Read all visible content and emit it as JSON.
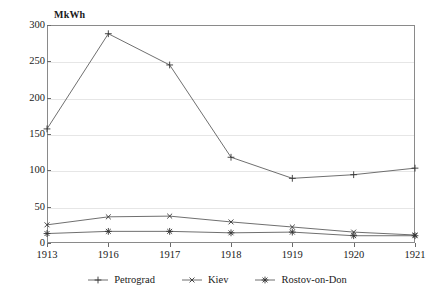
{
  "chart_data": {
    "type": "line",
    "title": "",
    "subtitle": "",
    "xlabel": "",
    "ylabel": "MkWh",
    "ylim": [
      0,
      300
    ],
    "yticks": [
      0,
      50,
      100,
      150,
      200,
      250,
      300
    ],
    "ytick_labels": [
      "0",
      "50",
      "100",
      "150",
      "200",
      "250",
      "300"
    ],
    "categories": [
      "1913",
      "1916",
      "1917",
      "1918",
      "1919",
      "1920",
      "1921"
    ],
    "x": [
      1913,
      1916,
      1917,
      1918,
      1919,
      1920,
      1921
    ],
    "grid": true,
    "grid_axis": "y",
    "legend_position": "bottom-center",
    "series": [
      {
        "name": "Petrograd",
        "marker": "plus",
        "values": [
          157,
          288,
          245,
          118,
          89,
          94,
          103
        ]
      },
      {
        "name": "Kiev",
        "marker": "x-cross",
        "values": [
          25,
          36,
          37,
          29,
          22,
          15,
          11
        ]
      },
      {
        "name": "Rostov-on-Don",
        "marker": "asterisk",
        "values": [
          13,
          16,
          16,
          14,
          15,
          10,
          10
        ]
      }
    ]
  },
  "axes": {
    "y_axis_unit_label": "MkWh"
  },
  "legend": {
    "items": [
      {
        "label": "Petrograd",
        "marker": "plus"
      },
      {
        "label": "Kiev",
        "marker": "x-cross"
      },
      {
        "label": "Rostov-on-Don",
        "marker": "asterisk"
      }
    ]
  },
  "colors": {
    "line": "#5f5f5f",
    "marker": "#333333",
    "grid": "#e6e6e6",
    "frame": "#8a8a8a",
    "text": "#1a1a1a",
    "background": "#ffffff"
  }
}
